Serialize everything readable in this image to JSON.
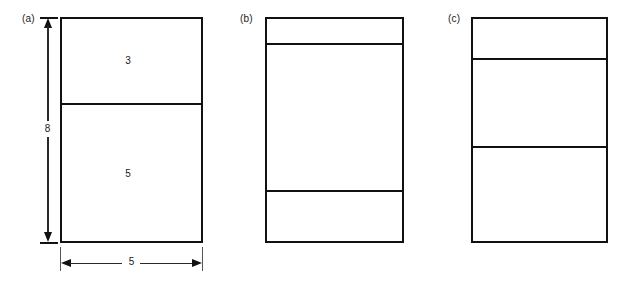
{
  "figure": {
    "background_color": "#ffffff",
    "line_color": "#111111",
    "text_color": "#1a1a1a"
  },
  "panels": [
    {
      "label": "(a)",
      "label_x": 22,
      "label_y": 13,
      "rect": {
        "x": 60,
        "y": 17,
        "width": 143,
        "height": 226
      },
      "dividers": [
        103
      ],
      "cell_labels": [
        {
          "text": "3",
          "x": 123,
          "y": 55
        },
        {
          "text": "5",
          "x": 123,
          "y": 168
        }
      ],
      "dimensions": [
        {
          "name": "height-dimension",
          "orientation": "vertical",
          "value": "8",
          "x": 48,
          "y_start": 17,
          "y_end": 243,
          "text_x": 42,
          "text_y": 123
        },
        {
          "name": "width-dimension",
          "orientation": "horizontal",
          "value": "5",
          "y": 263,
          "x_start": 60,
          "x_end": 203,
          "text_x": 125,
          "text_y": 257
        }
      ]
    },
    {
      "label": "(b)",
      "label_x": 240,
      "label_y": 13,
      "rect": {
        "x": 265,
        "y": 17,
        "width": 139,
        "height": 226
      },
      "dividers": [
        43,
        190
      ],
      "cell_labels": [],
      "dimensions": []
    },
    {
      "label": "(c)",
      "label_x": 448,
      "label_y": 13,
      "rect": {
        "x": 471,
        "y": 17,
        "width": 137,
        "height": 226
      },
      "dividers": [
        58,
        146
      ],
      "cell_labels": [],
      "dimensions": []
    }
  ]
}
